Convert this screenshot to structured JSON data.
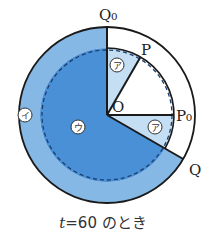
{
  "labels": {
    "q0": "Q₀",
    "p": "P",
    "o": "O",
    "p0": "P₀",
    "q": "Q"
  },
  "regions": {
    "a_top": "ア",
    "a_bottom": "ア",
    "i": "イ",
    "u": "ウ"
  },
  "caption": {
    "var": "t",
    "text": "=60 のとき"
  },
  "colors": {
    "outer_band": "#86b8e6",
    "inner_sector": "#4a90d6",
    "small_sector": "#c4def4",
    "stroke": "#1a1a1a",
    "dashed": "#1d3f6e"
  }
}
